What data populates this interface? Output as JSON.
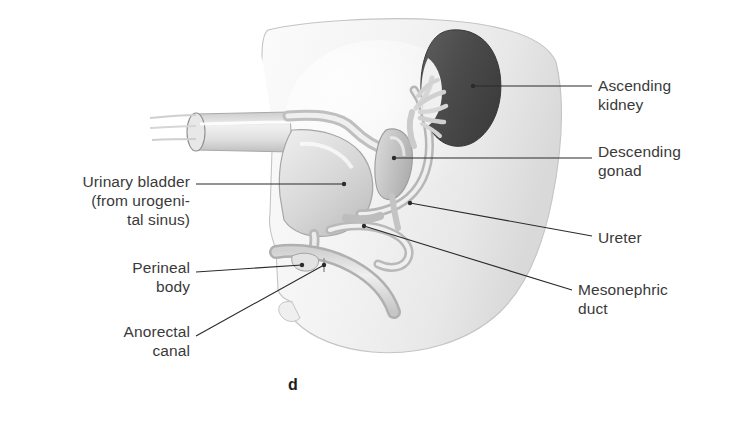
{
  "figure": {
    "letter": "d",
    "background_color": "#ffffff",
    "label_color": "#3a3a3a",
    "leader_color": "#2b2b2b"
  },
  "labels": {
    "urinary_bladder": "Urinary bladder\n(from urogeni-\ntal sinus)",
    "perineal_body": "Perineal\nbody",
    "anorectal_canal": "Anorectal\ncanal",
    "ascending_kidney": "Ascending\nkidney",
    "descending_gonad": "Descending\ngonad",
    "ureter": "Ureter",
    "mesonephric_duct": "Mesonephric\nduct"
  },
  "anatomy": {
    "body_mass": {
      "name": "embryonic body / pelvic wall",
      "fill": "#f2f2f2",
      "stroke": "#c9c9c9"
    },
    "kidney": {
      "name": "ascending kidney",
      "fill": "#4f4f4f",
      "stroke": "#3b3b3b",
      "calyces_fill": "#d8d8d8"
    },
    "gonad": {
      "name": "descending gonad",
      "fill": "#c8c8c8",
      "stroke": "#9a9a9a"
    },
    "bladder": {
      "name": "urinary bladder",
      "fill": "#d9d9d9",
      "stroke": "#a8a8a8"
    },
    "ureter": {
      "name": "ureter",
      "stroke": "#b4b4b4"
    },
    "mesonephric_duct": {
      "name": "mesonephric duct",
      "stroke": "#bdbdbd"
    },
    "anorectal_canal": {
      "name": "anorectal canal",
      "fill": "#dcdcdc",
      "stroke": "#ababab"
    },
    "cut_tube": {
      "name": "cut umbilical / urachal tube",
      "fill": "#e4e4e4",
      "stroke": "#9e9e9e"
    },
    "perineal_body": {
      "name": "perineal body",
      "fill": "#e0e0e0",
      "stroke": "#a5a5a5"
    }
  },
  "leaders": [
    {
      "name": "leader-urinary-bladder",
      "dot": [
        344,
        184
      ]
    },
    {
      "name": "leader-perineal-body",
      "dot": [
        302,
        265
      ]
    },
    {
      "name": "leader-anorectal-canal",
      "dot": [
        324,
        265
      ]
    },
    {
      "name": "leader-ascending-kidney",
      "dot": [
        473,
        86
      ]
    },
    {
      "name": "leader-descending-gonad",
      "dot": [
        394,
        158
      ]
    },
    {
      "name": "leader-ureter",
      "dot": [
        410,
        203
      ]
    },
    {
      "name": "leader-mesonephric-duct",
      "dot": [
        364,
        226
      ]
    }
  ]
}
